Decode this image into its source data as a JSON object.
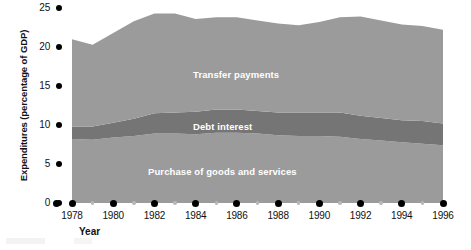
{
  "chart_data": {
    "type": "area",
    "stacked": true,
    "title": "",
    "xlabel": "Year",
    "ylabel": "Expenditures (percentage of GDP)",
    "xlim": [
      1978,
      1996
    ],
    "ylim": [
      0,
      25
    ],
    "grid": false,
    "legend_position": "inline-labels",
    "y_ticks": [
      0,
      5,
      10,
      15,
      20,
      25
    ],
    "y_tick_labels": [
      "0",
      "5",
      "10",
      "15",
      "20",
      "25"
    ],
    "x_ticks": [
      1978,
      1980,
      1982,
      1984,
      1986,
      1988,
      1990,
      1992,
      1994,
      1996
    ],
    "x_tick_labels": [
      "1978",
      "1980",
      "1982",
      "1984",
      "1986",
      "1988",
      "1990",
      "1992",
      "1994",
      "1996"
    ],
    "x_minor_ticks": [
      1979,
      1981,
      1983,
      1985,
      1987,
      1989,
      1991,
      1993,
      1995
    ],
    "x": [
      1978,
      1979,
      1980,
      1981,
      1982,
      1983,
      1984,
      1985,
      1986,
      1987,
      1988,
      1989,
      1990,
      1991,
      1992,
      1993,
      1994,
      1995,
      1996
    ],
    "series": [
      {
        "name": "Purchase of goods and services",
        "color": "#9b9b9b",
        "label_position": "bottom-band",
        "values": [
          8.2,
          8.1,
          8.4,
          8.6,
          8.9,
          8.9,
          8.8,
          9.0,
          9.0,
          8.9,
          8.7,
          8.6,
          8.6,
          8.5,
          8.2,
          8.0,
          7.8,
          7.6,
          7.4
        ]
      },
      {
        "name": "Debt interest",
        "color": "#757575",
        "label_position": "middle-band",
        "values": [
          1.6,
          1.7,
          1.9,
          2.2,
          2.6,
          2.7,
          2.9,
          3.0,
          3.0,
          2.9,
          2.9,
          3.0,
          3.0,
          3.1,
          3.0,
          2.9,
          2.8,
          2.9,
          2.8
        ]
      },
      {
        "name": "Transfer payments",
        "color": "#9b9b9b",
        "label_position": "top-band",
        "values": [
          11.2,
          10.5,
          11.5,
          12.5,
          12.8,
          12.7,
          11.9,
          11.8,
          11.8,
          11.6,
          11.4,
          11.2,
          11.6,
          12.2,
          12.7,
          12.5,
          12.3,
          12.2,
          12.0
        ]
      }
    ],
    "totals": [
      21.0,
      20.3,
      21.8,
      23.3,
      24.3,
      24.3,
      23.6,
      23.8,
      23.8,
      23.4,
      23.0,
      22.8,
      23.2,
      23.8,
      23.9,
      23.4,
      22.9,
      22.7,
      22.2
    ]
  },
  "labels": {
    "transfer_payments": "Transfer payments",
    "debt_interest": "Debt interest",
    "purchase_goods_services": "Purchase of goods and services",
    "y_axis_title": "Expenditures (percentage of GDP)",
    "x_axis_title": "Year"
  },
  "colors": {
    "light_band": "#9b9b9b",
    "dark_band": "#757575",
    "axis_dot": "#000000",
    "minor_dot": "#b9b9b9",
    "text": "#111111",
    "label_text": "#ffffff"
  }
}
